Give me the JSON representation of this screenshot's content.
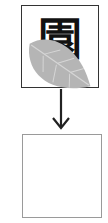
{
  "diagram": {
    "top_box": {
      "character": "園",
      "border_color": "#333333"
    },
    "leaf": {
      "color": "#b5b5b5",
      "vein_color": "#d6d6d6"
    },
    "arrow": {
      "direction": "down",
      "color": "#222222"
    },
    "bottom_box": {
      "content": "",
      "border_color": "#9a9a9a"
    }
  }
}
